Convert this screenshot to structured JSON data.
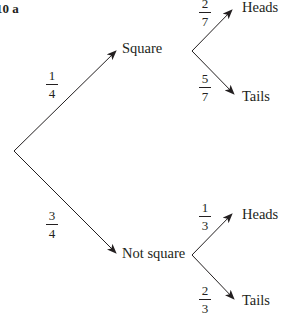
{
  "question_label": "10 a",
  "root": {
    "branches": [
      {
        "outcome": "Square",
        "probability": {
          "num": "1",
          "den": "4"
        },
        "branches": [
          {
            "outcome": "Heads",
            "probability": {
              "num": "2",
              "den": "7"
            }
          },
          {
            "outcome": "Tails",
            "probability": {
              "num": "5",
              "den": "7"
            }
          }
        ]
      },
      {
        "outcome": "Not square",
        "probability": {
          "num": "3",
          "den": "4"
        },
        "branches": [
          {
            "outcome": "Heads",
            "probability": {
              "num": "1",
              "den": "3"
            }
          },
          {
            "outcome": "Tails",
            "probability": {
              "num": "2",
              "den": "3"
            }
          }
        ]
      }
    ]
  },
  "colors": {
    "ink": "#231f20",
    "background": "#ffffff"
  }
}
